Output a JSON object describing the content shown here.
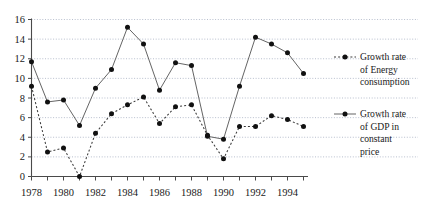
{
  "chart_data": {
    "type": "line",
    "title": "",
    "subtitle": "",
    "xlabel": "",
    "ylabel": "",
    "x": [
      1978,
      1979,
      1980,
      1981,
      1982,
      1983,
      1984,
      1985,
      1986,
      1987,
      1988,
      1989,
      1990,
      1991,
      1992,
      1993,
      1994,
      1995
    ],
    "xlim": [
      1978,
      1995
    ],
    "ylim": [
      0,
      16
    ],
    "ytick_values": [
      0,
      2,
      4,
      6,
      8,
      10,
      12,
      14,
      16
    ],
    "ytick_labels": [
      "0",
      "2",
      "4",
      "6",
      "8",
      "10",
      "12",
      "14",
      "16"
    ],
    "xtick_values": [
      1978,
      1980,
      1982,
      1984,
      1986,
      1988,
      1990,
      1992,
      1994
    ],
    "xtick_labels": [
      "1978",
      "1980",
      "1982",
      "1984",
      "1986",
      "1988",
      "1990",
      "1992",
      "1994"
    ],
    "xminor_tick_values": [
      1978,
      1979,
      1980,
      1981,
      1982,
      1983,
      1984,
      1985,
      1986,
      1987,
      1988,
      1989,
      1990,
      1991,
      1992,
      1993,
      1994,
      1995
    ],
    "grid": true,
    "grid_axis": "y",
    "legend_position": "right",
    "series": [
      {
        "name": "Growth rate of Energy consumption",
        "key": "energy",
        "style": "dotted",
        "marker": "filled-circle",
        "color": "#3a3a3a",
        "values": [
          9.2,
          2.5,
          2.9,
          0.0,
          4.4,
          6.4,
          7.3,
          8.1,
          5.4,
          7.1,
          7.3,
          4.2,
          1.8,
          5.1,
          5.1,
          6.2,
          5.8,
          5.1
        ]
      },
      {
        "name": "Growth rate of GDP in constant price",
        "key": "gdp",
        "style": "solid",
        "marker": "filled-circle",
        "color": "#5c5c5c",
        "values": [
          11.7,
          7.6,
          7.8,
          5.2,
          9.0,
          10.9,
          15.2,
          13.5,
          8.8,
          11.6,
          11.3,
          4.1,
          3.8,
          9.2,
          14.2,
          13.5,
          12.6,
          10.5
        ]
      }
    ]
  },
  "legend": {
    "items": [
      {
        "label_lines": [
          "Growth rate",
          "of Energy",
          "consumption"
        ],
        "style": "dotted",
        "swatch": "dotted-line-with-marker"
      },
      {
        "label_lines": [
          "Growth rate",
          "of GDP in",
          "constant",
          "price"
        ],
        "style": "solid",
        "swatch": "solid-line-with-marker"
      }
    ]
  },
  "colors": {
    "axis": "#4a4a4a",
    "grid": "#9aa4b8",
    "marker": "#111111",
    "text": "#1a1a1a",
    "background": "#ffffff"
  }
}
